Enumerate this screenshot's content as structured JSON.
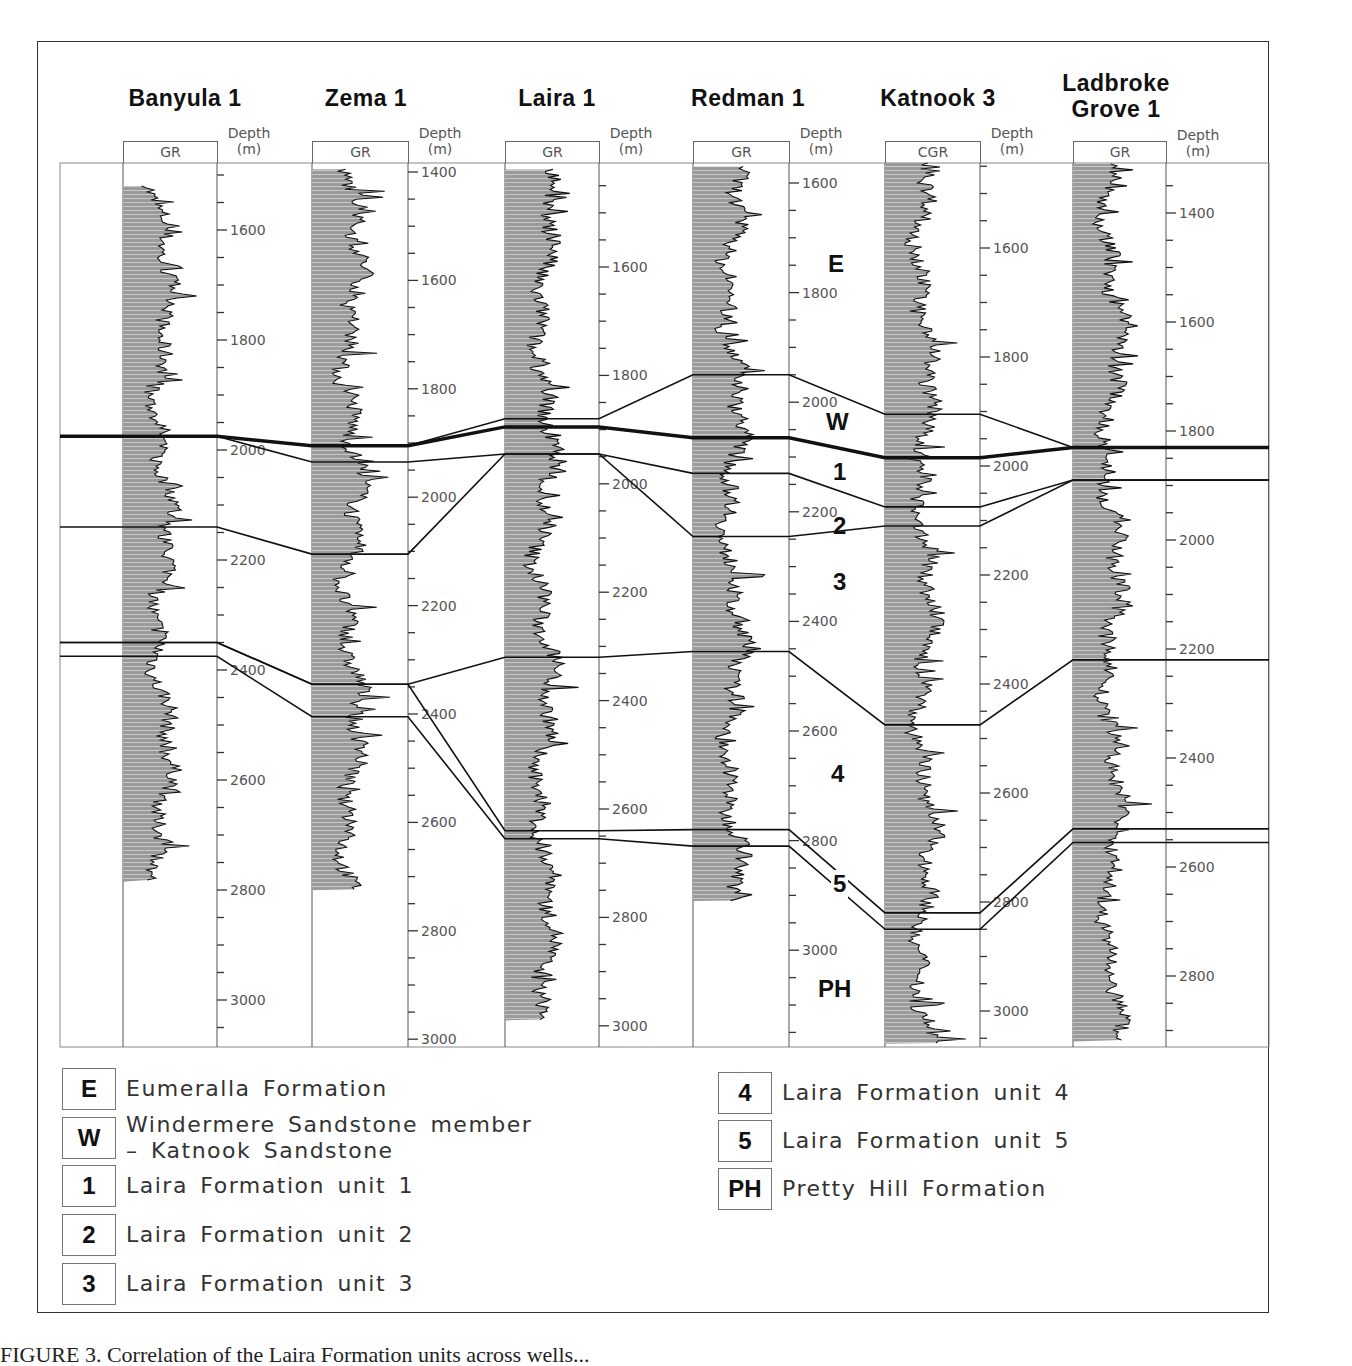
{
  "figure": {
    "caption_partial": "FIGURE 3. Correlation of the Laira Formation units across wells..."
  },
  "chart_data": {
    "type": "well-log-correlation",
    "title": "",
    "depth_unit_label": "Depth\n(m)",
    "wells": [
      {
        "name": "Banyula 1",
        "log": "GR",
        "depth_ticks": [
          1600,
          1800,
          2000,
          2200,
          2400,
          2600,
          2800,
          3000
        ],
        "axis_range_m": [
          1430,
          3090
        ],
        "log_interval_m": [
          1520,
          2785
        ],
        "horizons_m": {
          "E_W": 1975,
          "W_1": 1975,
          "1_2": 1975,
          "2_3": 2140,
          "3_4": 2350,
          "4_5": 2350,
          "5_PH": 2375
        }
      },
      {
        "name": "Zema 1",
        "log": "GR",
        "depth_ticks": [
          1400,
          1600,
          1800,
          2000,
          2200,
          2400,
          2600,
          2800,
          3000
        ],
        "axis_range_m": [
          1400,
          3000
        ],
        "log_interval_m": [
          1395,
          2725
        ],
        "horizons_m": {
          "E_W": 1905,
          "W_1": 1905,
          "1_2": 1935,
          "2_3": 2105,
          "3_4": 2345,
          "4_5": 2345,
          "5_PH": 2405
        }
      },
      {
        "name": "Laira 1",
        "log": "GR",
        "depth_ticks": [
          1600,
          1800,
          2000,
          2200,
          2400,
          2600,
          2800,
          3000
        ],
        "axis_range_m": [
          1430,
          3010
        ],
        "log_interval_m": [
          1420,
          2990
        ],
        "horizons_m": {
          "E_W": 1880,
          "W_1": 1895,
          "1_2": 1945,
          "2_3": 1945,
          "3_4": 2320,
          "4_5": 2640,
          "5_PH": 2655
        }
      },
      {
        "name": "Redman 1",
        "log": "GR",
        "depth_ticks": [
          1600,
          1800,
          2000,
          2200,
          2400,
          2600,
          2800,
          3000
        ],
        "axis_range_m": [
          1570,
          3180
        ],
        "log_interval_m": [
          1570,
          2910
        ],
        "horizons_m": {
          "E_W": 1950,
          "W_1": 2065,
          "1_2": 2130,
          "2_3": 2245,
          "3_4": 2455,
          "4_5": 2780,
          "5_PH": 2810
        }
      },
      {
        "name": "Katnook 3",
        "log": "CGR",
        "depth_ticks": [
          1600,
          1800,
          2000,
          2200,
          2400,
          2600,
          2800,
          3000
        ],
        "axis_range_m": [
          1420,
          3060
        ],
        "log_interval_m": [
          1420,
          3060
        ],
        "horizons_m": {
          "E_W": 1905,
          "W_1": 1985,
          "1_2": 2075,
          "2_3": 2110,
          "3_4": 2475,
          "4_5": 2820,
          "5_PH": 2850
        }
      },
      {
        "name": "Ladbroke\nGrove 1",
        "log": "GR",
        "depth_ticks": [
          1400,
          1600,
          1800,
          2000,
          2200,
          2400,
          2600,
          2800
        ],
        "axis_range_m": [
          1310,
          2920
        ],
        "log_interval_m": [
          1310,
          2920
        ],
        "horizons_m": {
          "E_W": 1830,
          "W_1": 1830,
          "1_2": 1890,
          "2_3": 1890,
          "3_4": 2220,
          "4_5": 2530,
          "5_PH": 2555
        }
      }
    ],
    "zone_labels": [
      {
        "code": "E",
        "well_gap": 4
      },
      {
        "code": "W",
        "well_gap": 4
      },
      {
        "code": "1",
        "well_gap": 4
      },
      {
        "code": "2",
        "well_gap": 4
      },
      {
        "code": "3",
        "well_gap": 4
      },
      {
        "code": "4",
        "well_gap": 4
      },
      {
        "code": "5",
        "well_gap": 4
      },
      {
        "code": "PH",
        "well_gap": 4
      }
    ]
  },
  "legend": {
    "left": [
      {
        "code": "E",
        "label": "Eumeralla Formation"
      },
      {
        "code": "W",
        "label": "Windermere Sandstone member\n– Katnook Sandstone"
      },
      {
        "code": "1",
        "label": "Laira Formation unit 1"
      },
      {
        "code": "2",
        "label": "Laira Formation unit 2"
      },
      {
        "code": "3",
        "label": "Laira Formation unit 3"
      }
    ],
    "right": [
      {
        "code": "4",
        "label": "Laira Formation unit 4"
      },
      {
        "code": "5",
        "label": "Laira Formation unit 5"
      },
      {
        "code": "PH",
        "label": "Pretty Hill Formation"
      }
    ]
  }
}
